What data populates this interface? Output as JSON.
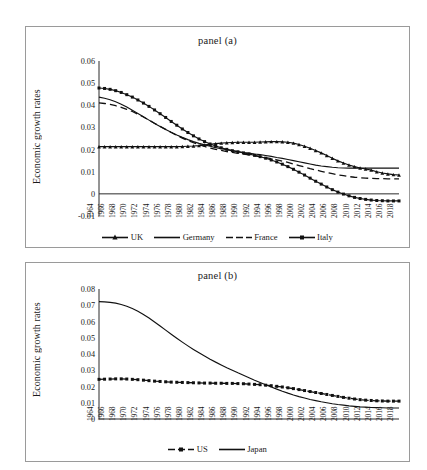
{
  "figure": {
    "background": "#ffffff",
    "ink": "#111111",
    "border_color": "#9a9a9a"
  },
  "panels": [
    {
      "id": "a",
      "title": "panel (a)",
      "ylabel": "Economic growth rates",
      "yticks": [
        "0.06",
        "0.05",
        "0.04",
        "0.03",
        "0.02",
        "0.01",
        "0",
        "-0.01"
      ],
      "legend": [
        {
          "label": "UK",
          "style": "solid-marker-triangle"
        },
        {
          "label": "Germany",
          "style": "solid"
        },
        {
          "label": "France",
          "style": "dashed"
        },
        {
          "label": "Italy",
          "style": "solid-marker-square"
        }
      ]
    },
    {
      "id": "b",
      "title": "panel (b)",
      "ylabel": "Economic growth rates",
      "yticks": [
        "0.08",
        "0.07",
        "0.06",
        "0.05",
        "0.04",
        "0.03",
        "0.02",
        "0.01",
        "0"
      ],
      "legend": [
        {
          "label": "US",
          "style": "dashed-marker-square"
        },
        {
          "label": "Japan",
          "style": "solid"
        }
      ]
    }
  ],
  "chart_data": [
    {
      "type": "line",
      "title": "panel (a)",
      "xlabel": "",
      "ylabel": "Economic growth rates",
      "ylim": [
        -0.01,
        0.06
      ],
      "ytick_values": [
        -0.01,
        0,
        0.01,
        0.02,
        0.03,
        0.04,
        0.05,
        0.06
      ],
      "grid": false,
      "legend_position": "bottom",
      "x": [
        1964,
        1965,
        1966,
        1967,
        1968,
        1969,
        1970,
        1971,
        1972,
        1973,
        1974,
        1975,
        1976,
        1977,
        1978,
        1979,
        1980,
        1981,
        1982,
        1983,
        1984,
        1985,
        1986,
        1987,
        1988,
        1989,
        1990,
        1991,
        1992,
        1993,
        1994,
        1995,
        1996,
        1997,
        1998,
        1999,
        2000,
        2001,
        2002,
        2003,
        2004,
        2005,
        2006,
        2007,
        2008,
        2009,
        2010,
        2011,
        2012,
        2013,
        2014,
        2015,
        2016,
        2017,
        2018
      ],
      "xtick_labels": [
        "1964",
        "1966",
        "1968",
        "1970",
        "1972",
        "1974",
        "1976",
        "1978",
        "1980",
        "1982",
        "1984",
        "1986",
        "1988",
        "1990",
        "1992",
        "1994",
        "1996",
        "1998",
        "2000",
        "2002",
        "2004",
        "2006",
        "2008",
        "2010",
        "2012",
        "2014",
        "2016",
        "2018"
      ],
      "series": [
        {
          "name": "UK",
          "style": "solid with triangle markers",
          "values": [
            0.0213,
            0.0213,
            0.0213,
            0.0213,
            0.0213,
            0.0213,
            0.0213,
            0.0213,
            0.0213,
            0.0213,
            0.0213,
            0.0213,
            0.0213,
            0.0213,
            0.0213,
            0.0214,
            0.0215,
            0.0216,
            0.0218,
            0.0221,
            0.0224,
            0.0227,
            0.0229,
            0.0231,
            0.0232,
            0.0233,
            0.0233,
            0.0233,
            0.0233,
            0.0234,
            0.0235,
            0.0236,
            0.0236,
            0.0235,
            0.0233,
            0.0229,
            0.0223,
            0.0215,
            0.0206,
            0.0196,
            0.0185,
            0.0173,
            0.0161,
            0.0149,
            0.0139,
            0.013,
            0.0123,
            0.0117,
            0.0112,
            0.0107,
            0.01,
            0.0094,
            0.009,
            0.0087,
            0.0085
          ]
        },
        {
          "name": "Germany",
          "style": "solid",
          "values": [
            0.0437,
            0.0432,
            0.0425,
            0.0416,
            0.0405,
            0.0392,
            0.0378,
            0.0363,
            0.0348,
            0.0333,
            0.0318,
            0.0304,
            0.0291,
            0.0278,
            0.0266,
            0.0255,
            0.0245,
            0.0236,
            0.0228,
            0.0221,
            0.0215,
            0.0209,
            0.0204,
            0.0199,
            0.0195,
            0.0191,
            0.0187,
            0.0184,
            0.018,
            0.0177,
            0.0173,
            0.0169,
            0.0164,
            0.016,
            0.0155,
            0.015,
            0.0145,
            0.014,
            0.0135,
            0.013,
            0.0126,
            0.0123,
            0.012,
            0.0118,
            0.0117,
            0.0116,
            0.0116,
            0.0116,
            0.0116,
            0.0116,
            0.0116,
            0.0116,
            0.0116,
            0.0116,
            0.0116
          ]
        },
        {
          "name": "France",
          "style": "dashed",
          "values": [
            0.0411,
            0.0408,
            0.0404,
            0.0398,
            0.0391,
            0.0382,
            0.0372,
            0.036,
            0.0347,
            0.0333,
            0.0319,
            0.0305,
            0.0291,
            0.0277,
            0.0264,
            0.0252,
            0.0241,
            0.0231,
            0.0222,
            0.0214,
            0.0207,
            0.0201,
            0.0196,
            0.0191,
            0.0187,
            0.0183,
            0.018,
            0.0176,
            0.0172,
            0.0168,
            0.0164,
            0.0159,
            0.0154,
            0.0148,
            0.0142,
            0.0135,
            0.0128,
            0.0121,
            0.0114,
            0.0108,
            0.0102,
            0.0096,
            0.0091,
            0.0086,
            0.0082,
            0.0078,
            0.0075,
            0.0073,
            0.0071,
            0.007,
            0.0069,
            0.0069,
            0.0068,
            0.0068,
            0.0068
          ]
        },
        {
          "name": "Italy",
          "style": "solid with square markers",
          "values": [
            0.0478,
            0.0476,
            0.0472,
            0.0466,
            0.0458,
            0.0448,
            0.0437,
            0.0424,
            0.041,
            0.0395,
            0.0379,
            0.0362,
            0.0345,
            0.0327,
            0.031,
            0.0293,
            0.0277,
            0.0262,
            0.0248,
            0.0236,
            0.0225,
            0.0216,
            0.0208,
            0.0201,
            0.0195,
            0.019,
            0.0185,
            0.018,
            0.0174,
            0.0168,
            0.0161,
            0.0153,
            0.0144,
            0.0134,
            0.0123,
            0.0111,
            0.0098,
            0.0085,
            0.0071,
            0.0057,
            0.0044,
            0.0031,
            0.0019,
            0.0008,
            -0.0001,
            -0.0009,
            -0.0016,
            -0.0021,
            -0.0025,
            -0.0028,
            -0.003,
            -0.0031,
            -0.0032,
            -0.0032,
            -0.0032
          ]
        }
      ]
    },
    {
      "type": "line",
      "title": "panel (b)",
      "xlabel": "",
      "ylabel": "Economic growth rates",
      "ylim": [
        0,
        0.08
      ],
      "ytick_values": [
        0,
        0.01,
        0.02,
        0.03,
        0.04,
        0.05,
        0.06,
        0.07,
        0.08
      ],
      "grid": false,
      "legend_position": "bottom",
      "x": [
        1964,
        1965,
        1966,
        1967,
        1968,
        1969,
        1970,
        1971,
        1972,
        1973,
        1974,
        1975,
        1976,
        1977,
        1978,
        1979,
        1980,
        1981,
        1982,
        1983,
        1984,
        1985,
        1986,
        1987,
        1988,
        1989,
        1990,
        1991,
        1992,
        1993,
        1994,
        1995,
        1996,
        1997,
        1998,
        1999,
        2000,
        2001,
        2002,
        2003,
        2004,
        2005,
        2006,
        2007,
        2008,
        2009,
        2010,
        2011,
        2012,
        2013,
        2014,
        2015,
        2016,
        2017,
        2018
      ],
      "xtick_labels": [
        "1964",
        "1966",
        "1968",
        "1970",
        "1972",
        "1974",
        "1976",
        "1978",
        "1980",
        "1982",
        "1984",
        "1986",
        "1988",
        "1990",
        "1992",
        "1994",
        "1996",
        "1998",
        "2000",
        "2002",
        "2004",
        "2006",
        "2008",
        "2010",
        "2012",
        "2014",
        "2016",
        "2018"
      ],
      "series": [
        {
          "name": "US",
          "style": "dashed with square markers",
          "values": [
            0.0244,
            0.0245,
            0.0246,
            0.0247,
            0.0247,
            0.0246,
            0.0244,
            0.0242,
            0.0239,
            0.0236,
            0.0233,
            0.0231,
            0.0229,
            0.0227,
            0.0226,
            0.0225,
            0.0224,
            0.0223,
            0.0222,
            0.0221,
            0.0221,
            0.022,
            0.022,
            0.0219,
            0.0219,
            0.0218,
            0.0217,
            0.0215,
            0.0213,
            0.0211,
            0.0208,
            0.0205,
            0.0201,
            0.0197,
            0.0192,
            0.0187,
            0.0181,
            0.0175,
            0.0169,
            0.0163,
            0.0157,
            0.0151,
            0.0145,
            0.0139,
            0.0133,
            0.0128,
            0.0123,
            0.0119,
            0.0116,
            0.0114,
            0.0112,
            0.0111,
            0.011,
            0.011,
            0.011
          ]
        },
        {
          "name": "Japan",
          "style": "solid",
          "values": [
            0.0722,
            0.0721,
            0.0718,
            0.0713,
            0.0705,
            0.0694,
            0.068,
            0.0663,
            0.0643,
            0.0621,
            0.0597,
            0.0572,
            0.0547,
            0.0522,
            0.0497,
            0.0473,
            0.045,
            0.0428,
            0.0407,
            0.0387,
            0.0368,
            0.035,
            0.0333,
            0.0316,
            0.03,
            0.0284,
            0.0269,
            0.0254,
            0.0239,
            0.0225,
            0.0211,
            0.0197,
            0.0184,
            0.0171,
            0.0159,
            0.0148,
            0.0138,
            0.0129,
            0.012,
            0.0113,
            0.0106,
            0.01,
            0.0094,
            0.0089,
            0.0085,
            0.0081,
            0.0078,
            0.0075,
            0.0073,
            0.0071,
            0.007,
            0.0069,
            0.0068,
            0.0068,
            0.0068
          ]
        }
      ]
    }
  ]
}
